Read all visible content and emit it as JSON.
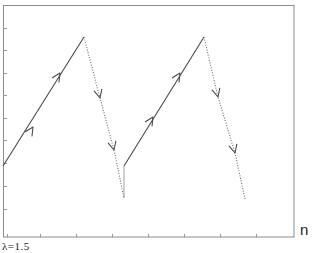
{
  "chart_data": {
    "type": "line",
    "title": "",
    "xlabel": "n",
    "ylabel": "",
    "annotation": "λ=1.5",
    "grid": false,
    "legend": null,
    "frame_px": {
      "left": 3,
      "top": 5,
      "right": 294,
      "bottom": 237
    },
    "y_ticks_px": [
      28,
      50,
      73,
      95,
      118,
      140,
      163,
      186,
      209
    ],
    "x_ticks_px": [
      7,
      40,
      76,
      112,
      148,
      184,
      220,
      256
    ],
    "series": [
      {
        "name": "cycle-1-rise",
        "style": "solid",
        "direction": "up-right",
        "points_px": [
          [
            3,
            166
          ],
          [
            84,
            37
          ]
        ],
        "arrows_px": [
          [
            33,
            127
          ],
          [
            60,
            73
          ]
        ]
      },
      {
        "name": "cycle-1-fall",
        "style": "dotted",
        "direction": "down-right",
        "points_px": [
          [
            84,
            37
          ],
          [
            100,
            98
          ],
          [
            114,
            150
          ],
          [
            124,
            198
          ]
        ],
        "arrows_px": [
          [
            100,
            98
          ],
          [
            114,
            150
          ]
        ]
      },
      {
        "name": "cycle-1-jump",
        "style": "thin-solid",
        "points_px": [
          [
            124,
            198
          ],
          [
            124,
            166
          ]
        ]
      },
      {
        "name": "cycle-2-rise",
        "style": "solid",
        "direction": "up-right",
        "points_px": [
          [
            124,
            166
          ],
          [
            204,
            37
          ]
        ],
        "arrows_px": [
          [
            153,
            117
          ],
          [
            180,
            73
          ]
        ]
      },
      {
        "name": "cycle-2-fall",
        "style": "dotted",
        "direction": "down-right",
        "points_px": [
          [
            204,
            37
          ],
          [
            218,
            97
          ],
          [
            235,
            153
          ],
          [
            245,
            199
          ]
        ],
        "arrows_px": [
          [
            218,
            97
          ],
          [
            235,
            153
          ]
        ]
      }
    ]
  },
  "labels": {
    "x_axis": "n",
    "parameter": "λ=1.5"
  }
}
